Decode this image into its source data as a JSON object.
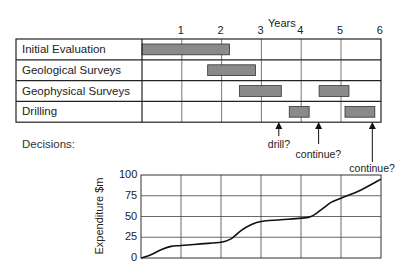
{
  "gantt": {
    "axis_title": "Years",
    "year_ticks": [
      "1",
      "2",
      "3",
      "4",
      "5",
      "6"
    ],
    "rows": [
      {
        "label": "Initial Evaluation",
        "bars": [
          [
            0,
            2.2
          ]
        ]
      },
      {
        "label": "Geological Surveys",
        "bars": [
          [
            1.65,
            2.85
          ]
        ]
      },
      {
        "label": "Geophysical Surveys",
        "bars": [
          [
            2.45,
            3.5
          ],
          [
            4.45,
            5.2
          ]
        ]
      },
      {
        "label": "Drilling",
        "bars": [
          [
            3.7,
            4.2
          ],
          [
            5.1,
            5.85
          ]
        ]
      }
    ],
    "bar_color": "#8a8a8a"
  },
  "decisions": {
    "label": "Decisions:",
    "items": [
      {
        "text": "drill?",
        "year": 3.45
      },
      {
        "text": "continue?",
        "year": 4.45
      },
      {
        "text": "continue?",
        "year": 5.8
      }
    ]
  },
  "chart_data": {
    "type": "line",
    "title": "",
    "xlabel": "Years",
    "ylabel": "Expenditure $m",
    "ylim": [
      0,
      100
    ],
    "xlim": [
      0,
      6
    ],
    "yticks": [
      "0",
      "25",
      "50",
      "75",
      "100"
    ],
    "grid": true,
    "x": [
      0,
      0.25,
      0.5,
      0.75,
      1.0,
      1.5,
      2.0,
      2.25,
      2.5,
      2.75,
      3.0,
      3.5,
      4.0,
      4.25,
      4.5,
      4.75,
      5.0,
      5.5,
      6.0
    ],
    "series": [
      {
        "name": "Cumulative expenditure",
        "values": [
          0,
          4,
          10,
          14,
          15,
          17,
          19,
          23,
          33,
          40,
          44,
          46,
          48,
          50,
          58,
          67,
          72,
          82,
          95
        ]
      }
    ]
  }
}
